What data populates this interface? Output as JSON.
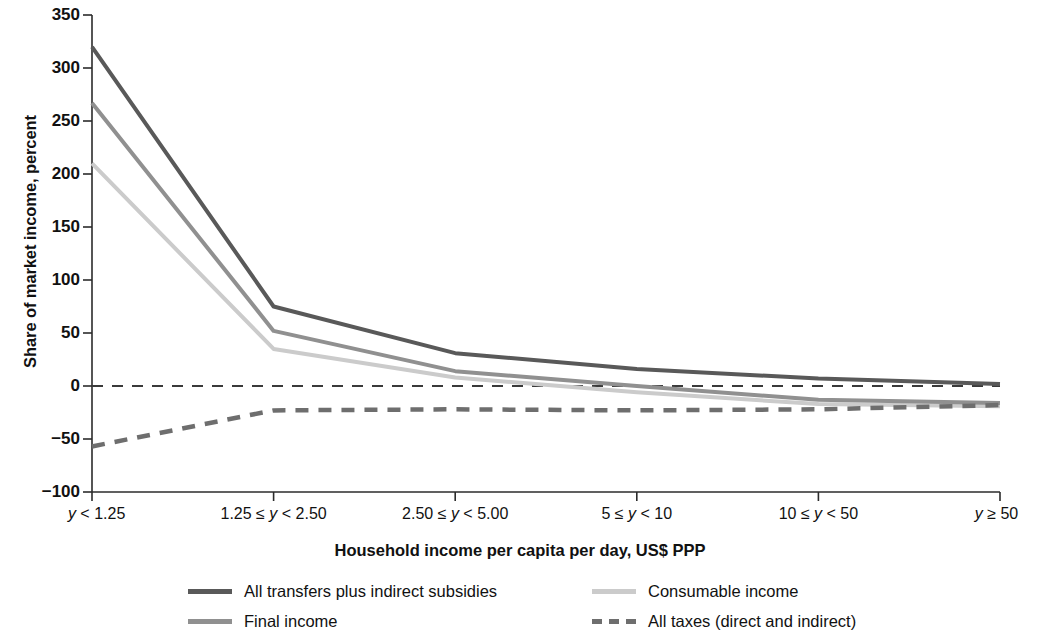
{
  "chart_data": {
    "type": "line",
    "title": "",
    "xlabel": "Household income per capita per day, US$ PPP",
    "ylabel": "Share of market income, percent",
    "categories": [
      "y < 1.25",
      "1.25 ≤ y < 2.50",
      "2.50 ≤ y < 5.00",
      "5 ≤ y < 10",
      "10 ≤ y < 50",
      "y ≥ 50"
    ],
    "ylim": [
      -100,
      350
    ],
    "yticks": [
      -100,
      -50,
      0,
      50,
      100,
      150,
      200,
      250,
      300,
      350
    ],
    "ytick_labels": [
      "−100",
      "−50",
      "0",
      "50",
      "100",
      "150",
      "200",
      "250",
      "300",
      "350"
    ],
    "grid": false,
    "zero_line": true,
    "legend_position": "bottom",
    "series": [
      {
        "name": "All transfers plus indirect subsidies",
        "values": [
          320,
          75,
          31,
          16,
          7,
          2
        ],
        "color": "#595959",
        "style": "solid",
        "width": 4
      },
      {
        "name": "Final income",
        "values": [
          267,
          52,
          14,
          0,
          -13,
          -16
        ],
        "color": "#909090",
        "style": "solid",
        "width": 4
      },
      {
        "name": "Consumable income",
        "values": [
          210,
          35,
          8,
          -6,
          -17,
          -19
        ],
        "color": "#cbcbcb",
        "style": "solid",
        "width": 4
      },
      {
        "name": "All taxes (direct and indirect)",
        "values": [
          -57,
          -23,
          -22,
          -23,
          -22,
          -18
        ],
        "color": "#6e6e6e",
        "style": "dashed",
        "width": 4.5
      }
    ],
    "zero_line_color": "#3a3a3a"
  },
  "axes": {
    "y_title": "Share of market income, percent",
    "x_title": "Household income per capita per day, US$ PPP",
    "y_tick_labels": [
      "350",
      "300",
      "250",
      "200",
      "150",
      "100",
      "50",
      "0",
      "−50",
      "−100"
    ],
    "x_tick_labels": [
      {
        "pre": "",
        "var": "y",
        "post": " < 1.25"
      },
      {
        "pre": "1.25 ≤ ",
        "var": "y",
        "post": " < 2.50"
      },
      {
        "pre": "2.50 ≤ ",
        "var": "y",
        "post": " < 5.00"
      },
      {
        "pre": "5 ≤ ",
        "var": "y",
        "post": " < 10"
      },
      {
        "pre": "10 ≤ ",
        "var": "y",
        "post": " < 50"
      },
      {
        "pre": "",
        "var": "y",
        "post": " ≥ 50"
      }
    ]
  },
  "legend": {
    "items": [
      {
        "label": "All transfers plus indirect subsidies",
        "color": "#595959",
        "style": "solid"
      },
      {
        "label": "Final income",
        "color": "#909090",
        "style": "solid"
      },
      {
        "label": "Consumable income",
        "color": "#cbcbcb",
        "style": "solid"
      },
      {
        "label": "All taxes (direct and indirect)",
        "color": "#6e6e6e",
        "style": "dashed"
      }
    ]
  }
}
